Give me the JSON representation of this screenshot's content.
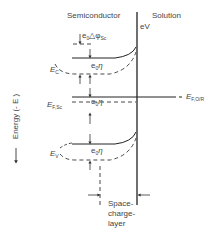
{
  "header": {
    "semiconductor": "Semiconductor",
    "solution": "Solution",
    "eV": "eV"
  },
  "y_axis": {
    "label": "Energy (- E )",
    "arrow": "down-arrow"
  },
  "labels": {
    "delta_phi": {
      "prefix": "e",
      "sub0": "0",
      "symbol": "△φ",
      "sub": "Sc"
    },
    "e0eta": {
      "prefix": "e",
      "sub0": "0",
      "symbol": "η"
    },
    "Ec": {
      "main": "E",
      "sub": "C"
    },
    "EF_sc": {
      "main": "E",
      "sub": "F,Sc"
    },
    "Ev": {
      "main": "E",
      "sub": "V"
    },
    "EF_redox": {
      "main": "E",
      "sub": "F,O/R"
    },
    "space_charge": [
      "Space-",
      "charge-",
      "layer"
    ]
  }
}
